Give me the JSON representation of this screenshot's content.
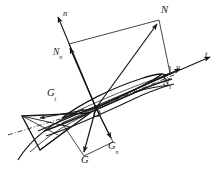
{
  "figure": {
    "type": "force-decomposition-diagram",
    "background_color": "#ffffff",
    "stroke_color": "#161616"
  },
  "axes": [
    {
      "id": "n",
      "label": "n",
      "role": "normal-axis",
      "direction": "up-left"
    },
    {
      "id": "t",
      "label": "t",
      "role": "tangential-axis",
      "direction": "right-up"
    }
  ],
  "vectors": [
    {
      "id": "N",
      "label": "N",
      "sub": "",
      "role": "resultant-normal-force"
    },
    {
      "id": "Nn",
      "label": "N",
      "sub": "n",
      "role": "normal-component"
    },
    {
      "id": "Nt",
      "label": "N",
      "sub": "t",
      "role": "tangential-component"
    },
    {
      "id": "G",
      "label": "G",
      "sub": "",
      "role": "resultant-weight"
    },
    {
      "id": "Gn",
      "label": "G",
      "sub": "n",
      "role": "weight-normal-component"
    },
    {
      "id": "Gt",
      "label": "G",
      "sub": "t",
      "role": "weight-tangential-component"
    },
    {
      "id": "v",
      "label": "v",
      "sub": "",
      "role": "velocity-vector"
    }
  ],
  "points": [
    {
      "id": "O",
      "label": "O",
      "role": "origin"
    }
  ],
  "labels": {
    "n": "n",
    "t": "t",
    "v": "v",
    "N": "N",
    "N_base": "N",
    "N_sub_n": "n",
    "N_sub_t": "t",
    "G": "G",
    "G_base": "G",
    "G_sub_n": "n",
    "G_sub_t": "t",
    "O": "O"
  }
}
